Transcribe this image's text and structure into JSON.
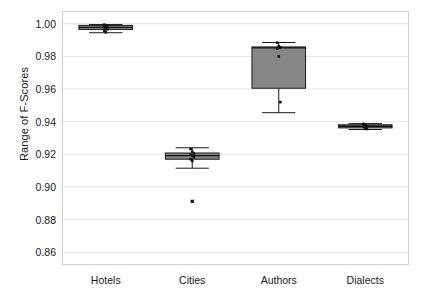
{
  "chart_data": {
    "type": "box",
    "title": "",
    "xlabel": "",
    "ylabel": "Range of F-Scores",
    "categories": [
      "Hotels",
      "Cities",
      "Authors",
      "Dialects"
    ],
    "ylim": [
      0.8525,
      1.0075
    ],
    "yticks": [
      0.86,
      0.88,
      0.9,
      0.92,
      0.94,
      0.96,
      0.98,
      1.0
    ],
    "ytick_labels": [
      "0.86",
      "0.88",
      "0.90",
      "0.92",
      "0.94",
      "0.96",
      "0.98",
      "1.00"
    ],
    "grid": true,
    "grid_axis": "y",
    "legend": "none",
    "box_facecolor": "#808080",
    "box_edgecolor": "#1a1a1a",
    "point_color": "#111111",
    "boxes": [
      {
        "label": "Hotels",
        "whisker_low": 0.9945,
        "q1": 0.9965,
        "median": 0.9978,
        "q3": 0.999,
        "whisker_high": 0.9995,
        "outliers": [],
        "points": [
          0.9994,
          0.9991,
          0.9988,
          0.998,
          0.9975,
          0.9966,
          0.9958,
          0.9948
        ]
      },
      {
        "label": "Cities",
        "whisker_low": 0.9115,
        "q1": 0.917,
        "median": 0.9192,
        "q3": 0.9208,
        "whisker_high": 0.924,
        "outliers": [
          0.8912
        ],
        "points": [
          0.9233,
          0.9215,
          0.9205,
          0.9198,
          0.919,
          0.9182,
          0.917,
          0.916
        ]
      },
      {
        "label": "Authors",
        "whisker_low": 0.9455,
        "q1": 0.9605,
        "median": 0.9852,
        "q3": 0.9858,
        "whisker_high": 0.9885,
        "outliers": [],
        "points": [
          0.9884,
          0.9862,
          0.9855,
          0.9848,
          0.98,
          0.952
        ]
      },
      {
        "label": "Dialects",
        "whisker_low": 0.9352,
        "q1": 0.9362,
        "median": 0.9372,
        "q3": 0.9381,
        "whisker_high": 0.9388,
        "outliers": [],
        "points": [
          0.9386,
          0.9378,
          0.9372,
          0.9368,
          0.936,
          0.9355
        ]
      }
    ]
  },
  "axes": {
    "frame_color": "#cfcfcf",
    "grid_color": "#e6e6e6",
    "background": "#ffffff"
  }
}
